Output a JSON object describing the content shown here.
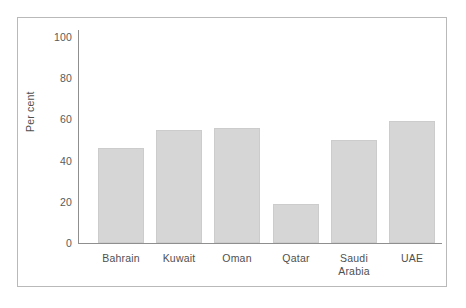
{
  "chart_data": {
    "type": "bar",
    "title": "",
    "subtitle": "",
    "xlabel": "",
    "ylabel": "Per cent",
    "categories": [
      "Bahrain",
      "Kuwait",
      "Oman",
      "Qatar",
      "Saudi Arabia",
      "UAE"
    ],
    "values": [
      46,
      55,
      56,
      19,
      50,
      59
    ],
    "ylim": [
      0,
      100
    ],
    "yticks": [
      0,
      20,
      40,
      60,
      80,
      100
    ],
    "ytick_labels": [
      "0",
      "20",
      "40",
      "60",
      "80",
      "100"
    ],
    "xtick_labels": [
      [
        "Bahrain"
      ],
      [
        "Kuwait"
      ],
      [
        "Oman"
      ],
      [
        "Qatar"
      ],
      [
        "Saudi",
        "Arabia"
      ],
      [
        "UAE"
      ]
    ],
    "grid": false,
    "legend": null,
    "legend_position": "none",
    "annotations": [],
    "bar_color": "#d6d6d6",
    "bar_edge_color": "#cccccc",
    "axis_color": "#8f8f8f",
    "text_color": "#4f4f4f",
    "frame_color": "#b9b9b9",
    "background": "#ffffff"
  }
}
